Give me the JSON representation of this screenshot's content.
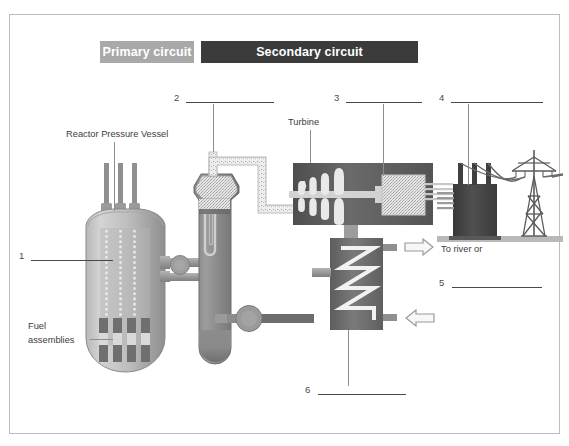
{
  "diagram": {
    "title_badges": {
      "primary": "Primary circuit",
      "secondary": "Secondary circuit"
    },
    "labels": {
      "reactor_pressure_vessel": "Reactor Pressure Vessel",
      "fuel_assemblies_line1": "Fuel",
      "fuel_assemblies_line2": "assemblies",
      "turbine": "Turbine",
      "to_river": "To river or"
    },
    "answer_blanks": [
      {
        "number": "1",
        "value": ""
      },
      {
        "number": "2",
        "value": ""
      },
      {
        "number": "3",
        "value": ""
      },
      {
        "number": "4",
        "value": ""
      },
      {
        "number": "5",
        "value": ""
      },
      {
        "number": "6",
        "value": ""
      }
    ],
    "colors": {
      "primary_badge": "#a9a9a9",
      "secondary_badge": "#3b3b3b",
      "border": "#bdbdbd",
      "vessel_light": "#c9c9c9",
      "vessel_dark": "#8e8e8e",
      "turbine_hall": "#5a5a5a",
      "generator": "#d9d9d9",
      "transformer": "#3f3f3f",
      "ground": "#b9b9b9",
      "pipe": "#9a9a9a",
      "text": "#3d3d3d"
    },
    "components": {
      "control_rod_drives": 3,
      "fuel_assemblies": 4,
      "turbine_blade_stages": 4,
      "transformer_bushings": 3,
      "condenser_coil_zigzags": 4,
      "pumps": 2
    }
  }
}
